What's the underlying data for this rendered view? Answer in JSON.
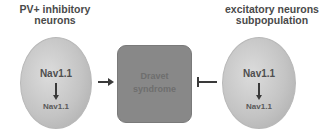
{
  "left_node": {
    "title_line1": "PV+ inhibitory",
    "title_line2": "neurons",
    "top_label": "Nav1.1",
    "bottom_label": "Nav1.1"
  },
  "center_node": {
    "line1": "Dravet",
    "line2": "syndrome"
  },
  "right_node": {
    "title_line1": "excitatory neurons",
    "title_line2": "subpopulation",
    "top_label": "Nav1.1",
    "bottom_label": "Nav1.1"
  },
  "edges": [
    {
      "from": "left_node",
      "to": "center_node",
      "type": "activation-arrow"
    },
    {
      "from": "right_node",
      "to": "center_node",
      "type": "inhibition-bar"
    }
  ],
  "colors": {
    "ellipse_fill": "#c4c4c4",
    "box_fill": "#888888",
    "arrow": "#3a3a3a",
    "title_text": "#4a4a4a"
  }
}
